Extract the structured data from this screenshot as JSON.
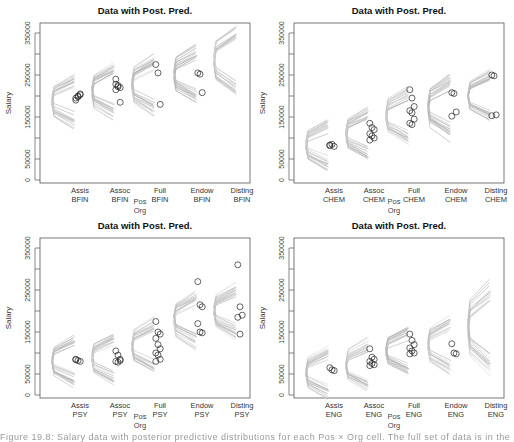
{
  "chart_data": [
    {
      "type": "scatter",
      "title": "Data with Post. Pred.",
      "xlabel": [
        "Pos",
        "Org"
      ],
      "ylabel": "Salary",
      "ylim": [
        0,
        350000
      ],
      "yticks": [
        0,
        50000,
        150000,
        250000,
        350000
      ],
      "grid": false,
      "org": "BFIN",
      "categories": [
        "Assis",
        "Assoc",
        "Full",
        "Endow",
        "Disting"
      ],
      "tick_labels": [
        [
          "Assis",
          "BFIN"
        ],
        [
          "Assoc",
          "BFIN"
        ],
        [
          "Full",
          "BFIN"
        ],
        [
          "Endow",
          "BFIN"
        ],
        [
          "Disting",
          "BFIN"
        ]
      ],
      "posterior_pred_center": [
        190000,
        210000,
        225000,
        250000,
        285000
      ],
      "posterior_pred_spread": [
        30000,
        30000,
        35000,
        30000,
        35000
      ],
      "data_points": [
        [
          195000,
          200000,
          205000,
          190000,
          198000,
          203000
        ],
        [
          240000,
          225000,
          220000,
          215000,
          222000,
          185000,
          228000
        ],
        [
          275000,
          255000,
          180000
        ],
        [
          255000,
          252000,
          208000
        ],
        []
      ]
    },
    {
      "type": "scatter",
      "title": "Data with Post. Pred.",
      "xlabel": [
        "Pos",
        "Org"
      ],
      "ylabel": "Salary",
      "ylim": [
        0,
        350000
      ],
      "yticks": [
        0,
        50000,
        150000,
        250000,
        350000
      ],
      "grid": false,
      "org": "CHEM",
      "categories": [
        "Assis",
        "Assoc",
        "Full",
        "Endow",
        "Disting"
      ],
      "tick_labels": [
        [
          "Assis",
          "CHEM"
        ],
        [
          "Assoc",
          "CHEM"
        ],
        [
          "Full",
          "CHEM"
        ],
        [
          "Endow",
          "CHEM"
        ],
        [
          "Disting",
          "CHEM"
        ]
      ],
      "posterior_pred_center": [
        85000,
        110000,
        155000,
        175000,
        195000
      ],
      "posterior_pred_spread": [
        28000,
        28000,
        30000,
        35000,
        30000
      ],
      "data_points": [
        [
          82000,
          85000,
          80000,
          83000
        ],
        [
          135000,
          125000,
          120000,
          110000,
          105000,
          100000,
          95000
        ],
        [
          215000,
          195000,
          175000,
          165000,
          160000,
          145000,
          135000,
          132000
        ],
        [
          208000,
          206000,
          162000,
          152000
        ],
        [
          250000,
          248000,
          155000,
          153000
        ]
      ]
    },
    {
      "type": "scatter",
      "title": "Data with Post. Pred.",
      "xlabel": [
        "Pos",
        "Org"
      ],
      "ylabel": "Salary",
      "ylim": [
        0,
        350000
      ],
      "yticks": [
        0,
        50000,
        150000,
        250000,
        350000
      ],
      "grid": false,
      "org": "PSY",
      "categories": [
        "Assis",
        "Assoc",
        "Full",
        "Endow",
        "Disting"
      ],
      "tick_labels": [
        [
          "Assis",
          "PSY"
        ],
        [
          "Assoc",
          "PSY"
        ],
        [
          "Full",
          "PSY"
        ],
        [
          "Endow",
          "PSY"
        ],
        [
          "Disting",
          "PSY"
        ]
      ],
      "posterior_pred_center": [
        85000,
        90000,
        115000,
        180000,
        200000
      ],
      "posterior_pred_spread": [
        28000,
        28000,
        30000,
        30000,
        30000
      ],
      "data_points": [
        [
          85000,
          82000,
          80000,
          84000
        ],
        [
          105000,
          95000,
          85000,
          80000,
          78000,
          82000
        ],
        [
          175000,
          150000,
          145000,
          135000,
          120000,
          110000,
          100000,
          95000,
          85000,
          80000
        ],
        [
          270000,
          215000,
          210000,
          170000,
          150000,
          148000
        ],
        [
          310000,
          210000,
          190000,
          185000,
          145000
        ]
      ]
    },
    {
      "type": "scatter",
      "title": "Data with Post. Pred.",
      "xlabel": [
        "Pos",
        "Org"
      ],
      "ylabel": "Salary",
      "ylim": [
        0,
        350000
      ],
      "yticks": [
        0,
        50000,
        150000,
        250000,
        350000
      ],
      "grid": false,
      "org": "ENG",
      "categories": [
        "Assis",
        "Assoc",
        "Full",
        "Endow",
        "Disting"
      ],
      "tick_labels": [
        [
          "Assis",
          "ENG"
        ],
        [
          "Assoc",
          "ENG"
        ],
        [
          "Full",
          "ENG"
        ],
        [
          "Endow",
          "ENG"
        ],
        [
          "Disting",
          "ENG"
        ]
      ],
      "posterior_pred_center": [
        55000,
        70000,
        105000,
        120000,
        160000
      ],
      "posterior_pred_spread": [
        28000,
        28000,
        25000,
        30000,
        50000
      ],
      "data_points": [
        [
          65000,
          60000,
          58000
        ],
        [
          110000,
          90000,
          85000,
          80000,
          75000,
          72000,
          70000
        ],
        [
          145000,
          130000,
          120000,
          112000,
          105000,
          100000,
          98000
        ],
        [
          122000,
          100000,
          98000
        ],
        []
      ]
    }
  ],
  "panels": [
    {
      "title": "Data with Post. Pred.",
      "ylabel": "Salary",
      "xlabel_pos": "Pos",
      "xlabel_org": "Org"
    },
    {
      "title": "Data with Post. Pred.",
      "ylabel": "Salary",
      "xlabel_pos": "Pos",
      "xlabel_org": "Org"
    },
    {
      "title": "Data with Post. Pred.",
      "ylabel": "Salary",
      "xlabel_pos": "Pos",
      "xlabel_org": "Org"
    },
    {
      "title": "Data with Post. Pred.",
      "ylabel": "Salary",
      "xlabel_pos": "Pos",
      "xlabel_org": "Org"
    }
  ],
  "caption": "Figure 19.8: Salary data with posterior predictive distributions for each Pos × Org cell. The full set of data is in the Mod..."
}
